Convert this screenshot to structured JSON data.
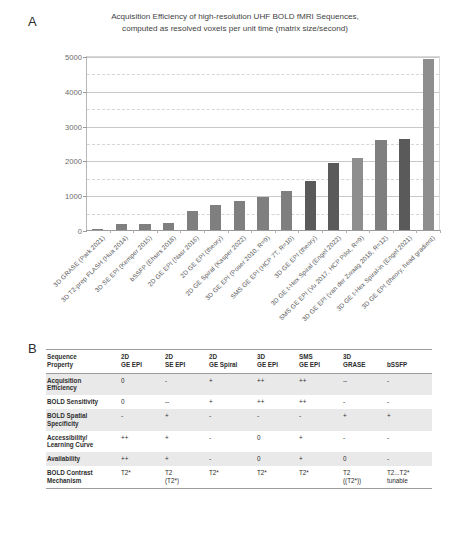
{
  "panels": {
    "a_letter": "A",
    "b_letter": "B"
  },
  "chart_data": {
    "type": "bar",
    "title": "Acquisition Efficiency of high-resolution UHF BOLD fMRI Sequences, computed as resolved voxels per unit time (matrix size/second)",
    "title_line1": "Acquisition Efficiency of high-resolution UHF BOLD fMRI Sequences,",
    "title_line2": "computed as resolved voxels per unit time (matrix size/second)",
    "xlabel": "",
    "ylabel": "",
    "ylim": [
      0,
      5000
    ],
    "ytick_labels": [
      "0",
      "1000",
      "2000",
      "3000",
      "4000",
      "5000"
    ],
    "yticks": [
      0,
      1000,
      2000,
      3000,
      4000,
      5000
    ],
    "minor_gridlines": [
      500,
      1500,
      2500,
      3500,
      4500
    ],
    "grid": true,
    "legend": "none",
    "bar_color_default": "#7f7f7f",
    "bar_color_dark": "#5a5a5a",
    "bar_color_light": "#8e8e8e",
    "categories": [
      "3D GRASE (Park 2021)",
      "3D T2-prep FLASH (Hua 2014)",
      "3D SE EPI (Kemper 2015)",
      "bSSFP (Ehses 2018)",
      "2D GE EPI (Nasr 2016)",
      "2D GE EPI (theory)",
      "2D GE Spiral (Kasper 2022)",
      "3D GE EPI (Poser 2010, R=9)",
      "SMS GE EPI (HCP 7T, R=10)",
      "3D GE EPI (theory)",
      "3D GE t-Hex Spiral (Engel 2022)",
      "SMS GE EPI (Vu 2017, HCP Pilot, R=9)",
      "3D GE EPI (van der Zwaag 2018, R=12)",
      "3D GE t-Hex Spiral-in (Engel 2021)",
      "3D GE EPI (theory, head gradient)"
    ],
    "values": [
      40,
      180,
      175,
      215,
      560,
      720,
      820,
      960,
      1130,
      1420,
      1920,
      2060,
      2600,
      2610,
      4900
    ]
  },
  "table": {
    "row_header_label_line1": "Sequence",
    "row_header_label_line2": "Property",
    "columns": [
      {
        "line1": "2D",
        "line2": "GE EPI"
      },
      {
        "line1": "2D",
        "line2": "SE EPI"
      },
      {
        "line1": "2D",
        "line2": "GE Spiral"
      },
      {
        "line1": "3D",
        "line2": "GE EPI"
      },
      {
        "line1": "SMS",
        "line2": "GE EPI"
      },
      {
        "line1": "3D",
        "line2": "GRASE"
      },
      {
        "line1": "bSSFP",
        "line2": ""
      }
    ],
    "rows": [
      {
        "label_line1": "Acquisition",
        "label_line2": "Efficiency",
        "shaded": true,
        "cells": [
          {
            "v1": "0",
            "v2": ""
          },
          {
            "v1": "-",
            "v2": ""
          },
          {
            "v1": "+",
            "v2": ""
          },
          {
            "v1": "++",
            "v2": ""
          },
          {
            "v1": "++",
            "v2": ""
          },
          {
            "v1": "--",
            "v2": ""
          },
          {
            "v1": "-",
            "v2": ""
          }
        ]
      },
      {
        "label_line1": "BOLD Sensitivity",
        "label_line2": "",
        "shaded": false,
        "cells": [
          {
            "v1": "0",
            "v2": ""
          },
          {
            "v1": "--",
            "v2": ""
          },
          {
            "v1": "+",
            "v2": ""
          },
          {
            "v1": "++",
            "v2": ""
          },
          {
            "v1": "++",
            "v2": ""
          },
          {
            "v1": "-",
            "v2": ""
          },
          {
            "v1": "-",
            "v2": ""
          }
        ]
      },
      {
        "label_line1": "BOLD Spatial",
        "label_line2": "Specificity",
        "shaded": true,
        "cells": [
          {
            "v1": "-",
            "v2": ""
          },
          {
            "v1": "+",
            "v2": ""
          },
          {
            "v1": "-",
            "v2": ""
          },
          {
            "v1": "-",
            "v2": ""
          },
          {
            "v1": "-",
            "v2": ""
          },
          {
            "v1": "+",
            "v2": ""
          },
          {
            "v1": "+",
            "v2": ""
          }
        ]
      },
      {
        "label_line1": "Accessibility/",
        "label_line2": "Learning Curve",
        "shaded": false,
        "cells": [
          {
            "v1": "++",
            "v2": ""
          },
          {
            "v1": "+",
            "v2": ""
          },
          {
            "v1": "-",
            "v2": ""
          },
          {
            "v1": "0",
            "v2": ""
          },
          {
            "v1": "+",
            "v2": ""
          },
          {
            "v1": "-",
            "v2": ""
          },
          {
            "v1": "-",
            "v2": ""
          }
        ]
      },
      {
        "label_line1": "Availability",
        "label_line2": "",
        "shaded": true,
        "cells": [
          {
            "v1": "++",
            "v2": ""
          },
          {
            "v1": "+",
            "v2": ""
          },
          {
            "v1": "-",
            "v2": ""
          },
          {
            "v1": "0",
            "v2": ""
          },
          {
            "v1": "+",
            "v2": ""
          },
          {
            "v1": "0",
            "v2": ""
          },
          {
            "v1": "-",
            "v2": ""
          }
        ]
      },
      {
        "label_line1": "BOLD Contrast",
        "label_line2": "Mechanism",
        "shaded": false,
        "last": true,
        "cells": [
          {
            "v1": "T2*",
            "v2": ""
          },
          {
            "v1": "T2",
            "v2": "(T2*)"
          },
          {
            "v1": "T2*",
            "v2": ""
          },
          {
            "v1": "T2*",
            "v2": ""
          },
          {
            "v1": "T2*",
            "v2": ""
          },
          {
            "v1": "T2",
            "v2": "((T2*))"
          },
          {
            "v1": "T2...T2*",
            "v2": "tunable"
          }
        ]
      }
    ]
  }
}
